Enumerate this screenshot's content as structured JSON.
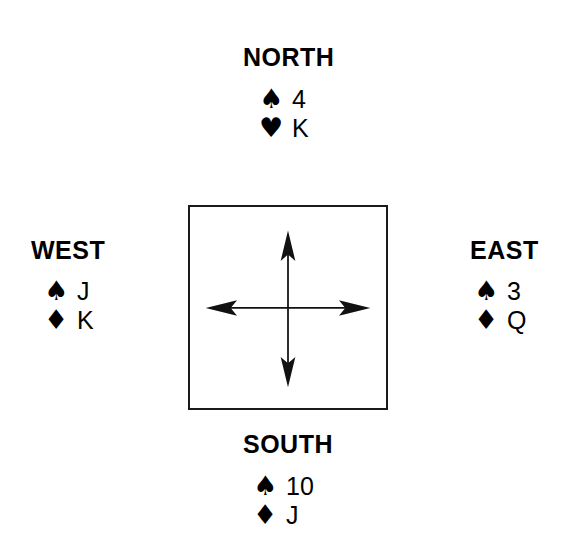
{
  "diagram": {
    "background_color": "#ffffff",
    "ink_color": "#000000",
    "border_color": "#1a1a1a"
  },
  "center": {
    "box_label": "compass-box",
    "arrows": [
      {
        "direction": "north",
        "symbol": "↑"
      },
      {
        "direction": "east",
        "symbol": "→"
      },
      {
        "direction": "south",
        "symbol": "↓"
      },
      {
        "direction": "west",
        "symbol": "←"
      }
    ]
  },
  "hands": {
    "north": {
      "label": "NORTH",
      "cards": [
        {
          "suit_name": "spade",
          "suit": "♠",
          "rank": "4"
        },
        {
          "suit_name": "heart",
          "suit": "♥",
          "rank": "K"
        }
      ]
    },
    "west": {
      "label": "WEST",
      "cards": [
        {
          "suit_name": "spade",
          "suit": "♠",
          "rank": "J"
        },
        {
          "suit_name": "diamond",
          "suit": "♦",
          "rank": "K"
        }
      ]
    },
    "east": {
      "label": "EAST",
      "cards": [
        {
          "suit_name": "spade",
          "suit": "♠",
          "rank": "3"
        },
        {
          "suit_name": "diamond",
          "suit": "♦",
          "rank": "Q"
        }
      ]
    },
    "south": {
      "label": "SOUTH",
      "cards": [
        {
          "suit_name": "spade",
          "suit": "♠",
          "rank": "10"
        },
        {
          "suit_name": "diamond",
          "suit": "♦",
          "rank": "J"
        }
      ]
    }
  }
}
